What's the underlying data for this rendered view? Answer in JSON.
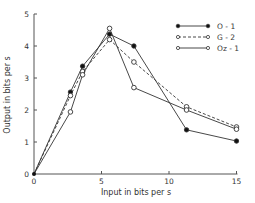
{
  "chart_data": {
    "type": "line",
    "title": "",
    "xlabel": "Input in bits per s",
    "ylabel": "Output in bits per s",
    "xlim": [
      0,
      15
    ],
    "ylim": [
      0,
      5
    ],
    "xticks": [
      0,
      5,
      10,
      15
    ],
    "yticks": [
      0,
      1,
      2,
      3,
      4,
      5
    ],
    "grid": false,
    "legend_position": "upper right",
    "series": [
      {
        "name": "O - 1",
        "marker": "filled-circle",
        "line": "solid",
        "x": [
          0,
          2.7,
          3.6,
          5.6,
          7.4,
          11.3,
          15
        ],
        "y": [
          0,
          2.56,
          3.37,
          4.37,
          4.0,
          1.38,
          1.03
        ]
      },
      {
        "name": "G - 2",
        "marker": "open-circle",
        "line": "dashed",
        "x": [
          0,
          2.7,
          3.6,
          5.6,
          7.4,
          11.3,
          15
        ],
        "y": [
          0,
          2.45,
          3.2,
          4.2,
          3.5,
          2.1,
          1.47
        ]
      },
      {
        "name": "Oz - 1",
        "marker": "open-circle",
        "line": "solid",
        "x": [
          0,
          2.7,
          3.6,
          5.6,
          7.4,
          11.3,
          15
        ],
        "y": [
          0,
          1.94,
          3.1,
          4.55,
          2.7,
          2.0,
          1.4
        ]
      }
    ]
  },
  "legend": [
    "O - 1",
    "G - 2",
    "Oz - 1"
  ],
  "axes": {
    "xlabel": "Input in bits per s",
    "ylabel": "Output in bits per s",
    "xtick_labels": [
      "0",
      "5",
      "10",
      "15"
    ],
    "ytick_labels": [
      "0",
      "1",
      "2",
      "3",
      "4",
      "5"
    ]
  }
}
